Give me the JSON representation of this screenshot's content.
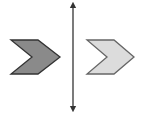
{
  "diagram": {
    "type": "geometric-transformation",
    "background": "#ffffff",
    "line": {
      "orientation": "vertical",
      "x": 73,
      "y1": 3,
      "y2": 111,
      "color": "#333333",
      "arrows": [
        "top",
        "bottom"
      ]
    },
    "shapes": [
      {
        "name": "original-chevron",
        "direction": "right",
        "fill": "#8a8a8a",
        "stroke": "#333333",
        "points": "11,40 38,40 60,57 38,74 11,74 32,57"
      },
      {
        "name": "image-chevron",
        "direction": "right",
        "fill": "#dcdcdc",
        "stroke": "#666666",
        "points": "87,40 114,40 134,57 114,74 87,74 107,57"
      }
    ]
  }
}
